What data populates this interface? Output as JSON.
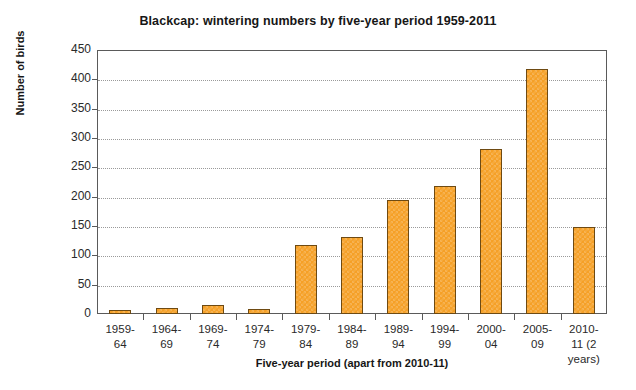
{
  "chart_data": {
    "type": "bar",
    "title": "Blackcap: wintering numbers by five-year period 1959-2011",
    "xlabel": "Five-year period (apart from 2010-11)",
    "ylabel": "Number of birds",
    "categories": [
      "1959-\n64",
      "1964-\n69",
      "1969-\n74",
      "1974-\n79",
      "1979-\n84",
      "1984-\n89",
      "1989-\n94",
      "1994-\n99",
      "2000-\n04",
      "2005-\n09",
      "2010-\n11 (2\nyears)"
    ],
    "values": [
      7,
      10,
      16,
      8,
      117,
      131,
      195,
      219,
      281,
      418,
      148
    ],
    "ylim": [
      0,
      450
    ],
    "ytick_labels": [
      "0",
      "50",
      "100",
      "150",
      "200",
      "250",
      "300",
      "350",
      "400",
      "450"
    ],
    "ytick_values": [
      0,
      50,
      100,
      150,
      200,
      250,
      300,
      350,
      400,
      450
    ],
    "grid": "horizontal-dotted",
    "legend": "none",
    "bar_color": "#f5a027",
    "bar_edge_color": "#6e4a12",
    "grid_color": "#9a9a9a",
    "axis_color": "#5a5a5a"
  }
}
